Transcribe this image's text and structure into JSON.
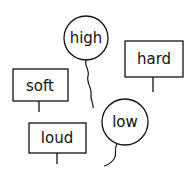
{
  "items": [
    {
      "type": "balloon",
      "word": "high"
    },
    {
      "type": "sign",
      "word": "hard"
    },
    {
      "type": "sign",
      "word": "soft"
    },
    {
      "type": "balloon",
      "word": "low"
    },
    {
      "type": "sign",
      "word": "loud"
    }
  ],
  "colors": {
    "stroke": "#111111",
    "background": "#ffffff"
  }
}
